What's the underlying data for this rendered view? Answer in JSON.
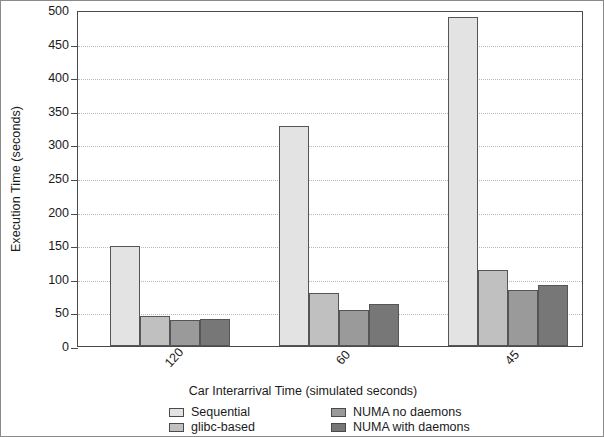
{
  "chart_data": {
    "type": "bar",
    "title": "",
    "xlabel": "Car Interarrival Time (simulated seconds)",
    "ylabel": "Execution Time (seconds)",
    "categories": [
      "120",
      "60",
      "45"
    ],
    "ylim": [
      0,
      500
    ],
    "yticks": [
      0,
      50,
      100,
      150,
      200,
      250,
      300,
      350,
      400,
      450,
      500
    ],
    "ytick_labels": [
      "0",
      "50",
      "100",
      "150",
      "200",
      "250",
      "300",
      "350",
      "400",
      "450",
      "500"
    ],
    "grid": true,
    "legend_position": "bottom",
    "series": [
      {
        "name": "Sequential",
        "color": "#e3e3e3",
        "values": [
          149,
          327,
          490
        ]
      },
      {
        "name": "glibc-based",
        "color": "#c0c0c0",
        "values": [
          45,
          79,
          113
        ]
      },
      {
        "name": "NUMA no daemons",
        "color": "#9a9a9a",
        "values": [
          38,
          53,
          83
        ]
      },
      {
        "name": "NUMA with daemons",
        "color": "#777777",
        "values": [
          40,
          62,
          91
        ]
      }
    ]
  }
}
